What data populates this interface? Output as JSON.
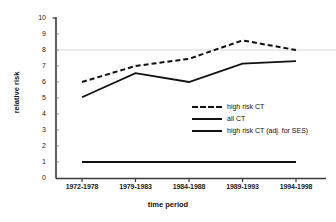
{
  "chart_data": {
    "type": "line",
    "title": "",
    "xlabel": "time period",
    "ylabel": "relative risk",
    "categories": [
      "1972-1978",
      "1979-1983",
      "1984-1988",
      "1989-1993",
      "1994-1998"
    ],
    "ylim": [
      0,
      10
    ],
    "ytick_labels": [
      "10",
      "9",
      "8",
      "7",
      "6",
      "5",
      "4",
      "3",
      "2",
      "1",
      "0"
    ],
    "grid": "single horizontal gridline at y=8",
    "legend_position": "inside lower-right of plot area",
    "series": [
      {
        "name": "high risk CT",
        "style": "dashed",
        "color": "#111111",
        "values": [
          6.0,
          7.0,
          7.45,
          8.6,
          8.0
        ]
      },
      {
        "name": "all CT",
        "style": "solid",
        "color": "#111111",
        "values": [
          1.0,
          1.0,
          1.0,
          1.0,
          1.0
        ]
      },
      {
        "name": "high risk CT (adj. for SES)",
        "style": "solid",
        "color": "#111111",
        "values": [
          5.05,
          6.55,
          6.0,
          7.15,
          7.3
        ]
      }
    ]
  },
  "axes": {
    "y_title": "relative risk",
    "x_title": "time period"
  },
  "legend": {
    "items": [
      {
        "label": "high risk CT",
        "style": "dashed"
      },
      {
        "label": "all CT",
        "style": "solid-thin"
      },
      {
        "label": "high risk CT (adj. for SES)",
        "style": "solid"
      }
    ]
  },
  "colors": {
    "line": "#111111",
    "axis": "#3a3a3a",
    "gridline": "#d9d9d9",
    "background": "#ffffff"
  }
}
